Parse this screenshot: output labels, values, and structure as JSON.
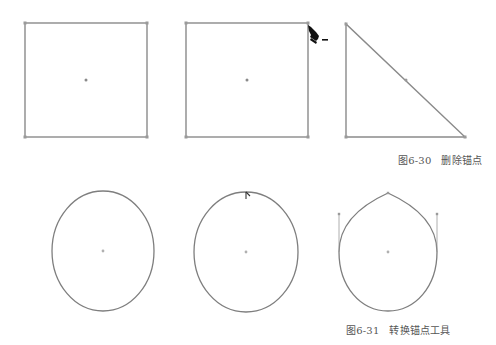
{
  "figures": [
    {
      "number": "图6-30",
      "title": "删除锚点",
      "panels": [
        {
          "shape": "square",
          "label": "original-square"
        },
        {
          "shape": "square",
          "label": "square-with-delete-anchor-cursor",
          "cursor": "pen-minus"
        },
        {
          "shape": "right-triangle",
          "label": "result-triangle"
        }
      ]
    },
    {
      "number": "图6-31",
      "title": "转换锚点工具",
      "panels": [
        {
          "shape": "ellipse",
          "label": "original-ellipse"
        },
        {
          "shape": "ellipse",
          "label": "ellipse-with-convert-anchor-cursor",
          "cursor": "convert-anchor"
        },
        {
          "shape": "teardrop",
          "label": "result-teardrop"
        }
      ]
    }
  ],
  "colors": {
    "stroke": "#8a8a8a",
    "anchor": "#9a9a9a",
    "center_point": "#a8a8a8",
    "cursor": "#111111",
    "caption": "#555555"
  }
}
